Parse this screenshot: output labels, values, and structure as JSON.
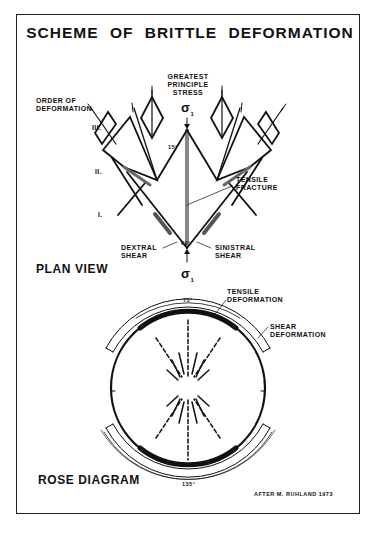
{
  "title": "SCHEME OF BRITTLE DEFORMATION",
  "plan_view": {
    "heading": "PLAN VIEW",
    "greatest_stress_label": [
      "GREATEST",
      "PRINCIPLE",
      "STRESS"
    ],
    "sigma_top": "σ",
    "sigma_top_sub": "1",
    "sigma_bottom": "σ",
    "sigma_bottom_sub": "1",
    "order_label": [
      "ORDER OF",
      "DEFORMATION"
    ],
    "orders": [
      "III.",
      "II.",
      "I."
    ],
    "angle_small": "15°",
    "angle_main": "60°",
    "tensile_fracture": [
      "TENSILE",
      "FRACTURE"
    ],
    "dextral": [
      "DEXTRAL",
      "SHEAR"
    ],
    "sinistral": [
      "SINISTRAL",
      "SHEAR"
    ]
  },
  "rose_diagram": {
    "heading": "ROSE DIAGRAM",
    "tensile_deformation": [
      "TENSILE",
      "DEFORMATION"
    ],
    "shear_deformation": [
      "SHEAR",
      "DEFORMATION"
    ],
    "angle_top": "75°",
    "angle_bottom": "135°"
  },
  "credit": "AFTER M. RUHLAND 1973"
}
